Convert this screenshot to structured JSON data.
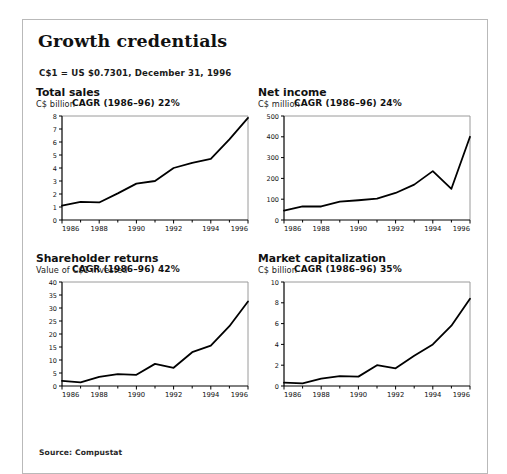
{
  "page": {
    "title": "Growth credentials",
    "fx_note": "C$1 = US $0.7301, December 31, 1996",
    "source": "Source: Compustat"
  },
  "chart_data": [
    {
      "type": "line",
      "title": "Total sales",
      "ylabel": "C$ billion",
      "xlabel": "",
      "annotation": "CAGR (1986–96) 22%",
      "x": [
        1986,
        1987,
        1988,
        1989,
        1990,
        1991,
        1992,
        1993,
        1994,
        1995,
        1996
      ],
      "categories": [
        "1986",
        "1987",
        "1988",
        "1989",
        "1990",
        "1991",
        "1992",
        "1993",
        "1994",
        "1995",
        "1996"
      ],
      "values": [
        1.1,
        1.4,
        1.35,
        2.05,
        2.8,
        3.0,
        4.0,
        4.4,
        4.7,
        6.2,
        7.85
      ],
      "yticks": [
        0,
        1,
        2,
        3,
        4,
        5,
        6,
        7,
        8
      ],
      "ytick_labels": [
        "0",
        "1",
        "2",
        "3",
        "4",
        "5",
        "6",
        "7",
        "8"
      ],
      "xticks_major": [
        1986,
        1988,
        1990,
        1992,
        1994,
        1996
      ],
      "xtick_labels": [
        "1986",
        "1988",
        "1990",
        "1992",
        "1994",
        "1996"
      ],
      "ylim": [
        0,
        8
      ],
      "xlim": [
        1986,
        1996
      ],
      "grid": false,
      "legend": "none"
    },
    {
      "type": "line",
      "title": "Net income",
      "ylabel": "C$ million",
      "xlabel": "",
      "annotation": "CAGR (1986–96) 24%",
      "x": [
        1986,
        1987,
        1988,
        1989,
        1990,
        1991,
        1992,
        1993,
        1994,
        1995,
        1996
      ],
      "categories": [
        "1986",
        "1987",
        "1988",
        "1989",
        "1990",
        "1991",
        "1992",
        "1993",
        "1994",
        "1995",
        "1996"
      ],
      "values": [
        45,
        65,
        65,
        88,
        95,
        103,
        130,
        170,
        235,
        150,
        400
      ],
      "yticks": [
        0,
        100,
        200,
        300,
        400,
        500
      ],
      "ytick_labels": [
        "0",
        "100",
        "200",
        "300",
        "400",
        "500"
      ],
      "xticks_major": [
        1986,
        1988,
        1990,
        1992,
        1994,
        1996
      ],
      "xtick_labels": [
        "1986",
        "1988",
        "1990",
        "1992",
        "1994",
        "1996"
      ],
      "ylim": [
        0,
        500
      ],
      "xlim": [
        1986,
        1996
      ],
      "grid": false,
      "legend": "none"
    },
    {
      "type": "line",
      "title": "Shareholder returns",
      "ylabel": "Value of C$1 invested",
      "xlabel": "",
      "annotation": "CAGR (1986–96) 42%",
      "x": [
        1986,
        1987,
        1988,
        1989,
        1990,
        1991,
        1992,
        1993,
        1994,
        1995,
        1996
      ],
      "categories": [
        "1986",
        "1987",
        "1988",
        "1989",
        "1990",
        "1991",
        "1992",
        "1993",
        "1994",
        "1995",
        "1996"
      ],
      "values": [
        2.0,
        1.4,
        3.5,
        4.6,
        4.3,
        8.5,
        7.0,
        13.0,
        15.5,
        23.0,
        32.5
      ],
      "yticks": [
        0,
        5,
        10,
        15,
        20,
        25,
        30,
        35,
        40
      ],
      "ytick_labels": [
        "0",
        "5",
        "10",
        "15",
        "20",
        "25",
        "30",
        "35",
        "40"
      ],
      "xticks_major": [
        1986,
        1988,
        1990,
        1992,
        1994,
        1996
      ],
      "xtick_labels": [
        "1986",
        "1988",
        "1990",
        "1992",
        "1994",
        "1996"
      ],
      "ylim": [
        0,
        40
      ],
      "xlim": [
        1986,
        1996
      ],
      "grid": false,
      "legend": "none"
    },
    {
      "type": "line",
      "title": "Market capitalization",
      "ylabel": "C$ billion",
      "xlabel": "",
      "annotation": "CAGR (1986–96) 35%",
      "x": [
        1986,
        1987,
        1988,
        1989,
        1990,
        1991,
        1992,
        1993,
        1994,
        1995,
        1996
      ],
      "categories": [
        "1986",
        "1987",
        "1988",
        "1989",
        "1990",
        "1991",
        "1992",
        "1993",
        "1994",
        "1995",
        "1996"
      ],
      "values": [
        0.32,
        0.25,
        0.7,
        0.95,
        0.9,
        2.0,
        1.7,
        2.9,
        4.0,
        5.8,
        8.4
      ],
      "yticks": [
        0,
        2,
        4,
        6,
        8,
        10
      ],
      "ytick_labels": [
        "0",
        "2",
        "4",
        "6",
        "8",
        "10"
      ],
      "xticks_major": [
        1986,
        1988,
        1990,
        1992,
        1994,
        1996
      ],
      "xtick_labels": [
        "1986",
        "1988",
        "1990",
        "1992",
        "1994",
        "1996"
      ],
      "ylim": [
        0,
        10
      ],
      "xlim": [
        1986,
        1996
      ],
      "grid": false,
      "legend": "none"
    }
  ],
  "colors": {
    "line": "#000000",
    "axis": "#000000",
    "frame": "#b9b9b9",
    "text": "#111111",
    "background": "#ffffff"
  }
}
